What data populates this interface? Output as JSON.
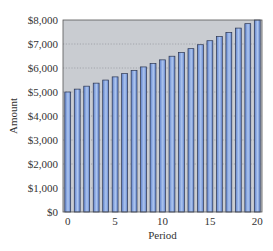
{
  "chart_data": {
    "type": "bar",
    "title": "",
    "xlabel": "Period",
    "ylabel": "Amount",
    "x": [
      0,
      1,
      2,
      3,
      4,
      5,
      6,
      7,
      8,
      9,
      10,
      11,
      12,
      13,
      14,
      15,
      16,
      17,
      18,
      19,
      20
    ],
    "values": [
      5000,
      5120,
      5243,
      5369,
      5498,
      5630,
      5765,
      5903,
      6045,
      6190,
      6339,
      6491,
      6647,
      6806,
      6970,
      7137,
      7308,
      7484,
      7663,
      7847,
      8036
    ],
    "ylim": [
      0,
      8000
    ],
    "xlim": [
      0,
      20
    ],
    "yticks": [
      0,
      1000,
      2000,
      3000,
      4000,
      5000,
      6000,
      7000,
      8000
    ],
    "ytick_labels": [
      "$0",
      "$1,000",
      "$2,000",
      "$3,000",
      "$4,000",
      "$5,000",
      "$6,000",
      "$7,000",
      "$8,000"
    ],
    "xticks": [
      0,
      5,
      10,
      15,
      20
    ],
    "xtick_labels": [
      "0",
      "5",
      "10",
      "15",
      "20"
    ],
    "grid": "horizontal-dotted",
    "legend": "none",
    "colors": {
      "plot_background": "#c9ccd1",
      "bar_fill_edge": "#5f82cc",
      "bar_fill_center": "#aec6ef",
      "bar_outline": "#2b3550",
      "gridline": "#9a9da3"
    }
  }
}
